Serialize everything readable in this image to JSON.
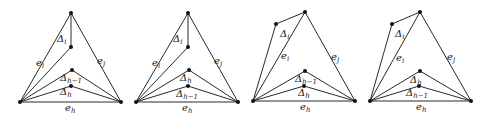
{
  "figure": {
    "panels": [
      {
        "id": "panel-1",
        "vertices": {
          "top": [
            71,
            13
          ],
          "inner": [
            71,
            47
          ],
          "upper_mid": [
            72,
            70
          ],
          "lower_mid": [
            71,
            86
          ],
          "left": [
            20,
            102
          ],
          "right": [
            121,
            102
          ]
        },
        "edges": [
          [
            "top",
            "left"
          ],
          [
            "top",
            "right"
          ],
          [
            "left",
            "right"
          ],
          [
            "top",
            "inner"
          ],
          [
            "inner",
            "left"
          ],
          [
            "upper_mid",
            "left"
          ],
          [
            "upper_mid",
            "right"
          ],
          [
            "lower_mid",
            "left"
          ],
          [
            "lower_mid",
            "right"
          ]
        ],
        "labels": [
          {
            "base": "Δ",
            "sub": "i",
            "pos": [
              57,
              42
            ]
          },
          {
            "base": "e",
            "sub": "i",
            "pos": [
              36,
              66
            ]
          },
          {
            "base": "e",
            "sub": "j",
            "pos": [
              97,
              64
            ]
          },
          {
            "base": "Δ",
            "sub": "h−1",
            "pos": [
              60,
              81
            ]
          },
          {
            "base": "Δ",
            "sub": "h",
            "pos": [
              60,
              95
            ]
          },
          {
            "base": "e",
            "sub": "h",
            "pos": [
              65,
              111
            ]
          }
        ]
      },
      {
        "id": "panel-2",
        "vertices": {
          "top": [
            188,
            13
          ],
          "inner": [
            188,
            47
          ],
          "upper_mid": [
            189,
            70
          ],
          "lower_mid": [
            188,
            86
          ],
          "left": [
            136,
            102
          ],
          "right": [
            238,
            102
          ]
        },
        "edges": [
          [
            "top",
            "left"
          ],
          [
            "top",
            "right"
          ],
          [
            "left",
            "right"
          ],
          [
            "top",
            "inner"
          ],
          [
            "inner",
            "left"
          ],
          [
            "upper_mid",
            "left"
          ],
          [
            "upper_mid",
            "right"
          ],
          [
            "lower_mid",
            "left"
          ],
          [
            "lower_mid",
            "right"
          ]
        ],
        "labels": [
          {
            "base": "Δ",
            "sub": "i",
            "pos": [
              173,
              42
            ]
          },
          {
            "base": "e",
            "sub": "i",
            "pos": [
              152,
              66
            ]
          },
          {
            "base": "e",
            "sub": "j",
            "pos": [
              214,
              64
            ]
          },
          {
            "base": "Δ",
            "sub": "h",
            "pos": [
              180,
              81
            ]
          },
          {
            "base": "Δ",
            "sub": "h−1",
            "pos": [
              176,
              97
            ]
          },
          {
            "base": "e",
            "sub": "h",
            "pos": [
              182,
              111
            ]
          }
        ]
      },
      {
        "id": "panel-3",
        "vertices": {
          "top": [
            305,
            12
          ],
          "outer": [
            276,
            24
          ],
          "upper_mid": [
            305,
            71
          ],
          "lower_mid": [
            304,
            86
          ],
          "left": [
            253,
            101
          ],
          "right": [
            355,
            101
          ]
        },
        "edges": [
          [
            "top",
            "left"
          ],
          [
            "top",
            "right"
          ],
          [
            "left",
            "right"
          ],
          [
            "top",
            "outer"
          ],
          [
            "outer",
            "left"
          ],
          [
            "upper_mid",
            "left"
          ],
          [
            "upper_mid",
            "right"
          ],
          [
            "lower_mid",
            "left"
          ],
          [
            "lower_mid",
            "right"
          ]
        ],
        "labels": [
          {
            "base": "Δ",
            "sub": "i",
            "pos": [
              280,
              37
            ]
          },
          {
            "base": "e",
            "sub": "i",
            "pos": [
              281,
              59
            ]
          },
          {
            "base": "e",
            "sub": "j",
            "pos": [
              331,
              60
            ]
          },
          {
            "base": "Δ",
            "sub": "h−1",
            "pos": [
              295,
              82
            ]
          },
          {
            "base": "Δ",
            "sub": "h",
            "pos": [
              298,
              96
            ]
          },
          {
            "base": "e",
            "sub": "h",
            "pos": [
              300,
              110
            ]
          }
        ]
      },
      {
        "id": "panel-4",
        "vertices": {
          "top": [
            420,
            12
          ],
          "outer": [
            392,
            24
          ],
          "upper_mid": [
            420,
            71
          ],
          "lower_mid": [
            419,
            86
          ],
          "left": [
            370,
            101
          ],
          "right": [
            471,
            101
          ]
        },
        "edges": [
          [
            "top",
            "left"
          ],
          [
            "top",
            "right"
          ],
          [
            "left",
            "right"
          ],
          [
            "top",
            "outer"
          ],
          [
            "outer",
            "left"
          ],
          [
            "upper_mid",
            "left"
          ],
          [
            "upper_mid",
            "right"
          ],
          [
            "lower_mid",
            "left"
          ],
          [
            "lower_mid",
            "right"
          ]
        ],
        "labels": [
          {
            "base": "Δ",
            "sub": "i",
            "pos": [
              395,
              37
            ]
          },
          {
            "base": "e",
            "sub": "i",
            "pos": [
              396,
              61
            ]
          },
          {
            "base": "e",
            "sub": "j",
            "pos": [
              447,
              60
            ]
          },
          {
            "base": "Δ",
            "sub": "h",
            "pos": [
              410,
              83
            ]
          },
          {
            "base": "Δ",
            "sub": "h−1",
            "pos": [
              406,
              96
            ]
          },
          {
            "base": "e",
            "sub": "h",
            "pos": [
              416,
              110
            ]
          }
        ]
      }
    ]
  }
}
